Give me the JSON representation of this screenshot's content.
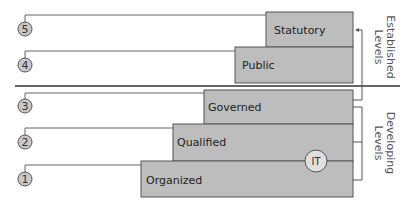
{
  "diagram": {
    "levels": [
      {
        "number": "5",
        "label": "Statutory",
        "group": "established"
      },
      {
        "number": "4",
        "label": "Public",
        "group": "established"
      },
      {
        "number": "3",
        "label": "Governed",
        "group": "developing"
      },
      {
        "number": "2",
        "label": "Qualified",
        "group": "developing"
      },
      {
        "number": "1",
        "label": "Organized",
        "group": "developing"
      }
    ],
    "it_marker": "IT",
    "groups": {
      "established": {
        "line1": "Established",
        "line2": "Levels"
      },
      "developing": {
        "line1": "Developing",
        "line2": "Levels"
      }
    },
    "colors": {
      "box_fill": "#bdbdbd",
      "circle_fill": "#c8c8c8",
      "it_fill": "#e0e0e0",
      "stroke": "#555555"
    }
  }
}
